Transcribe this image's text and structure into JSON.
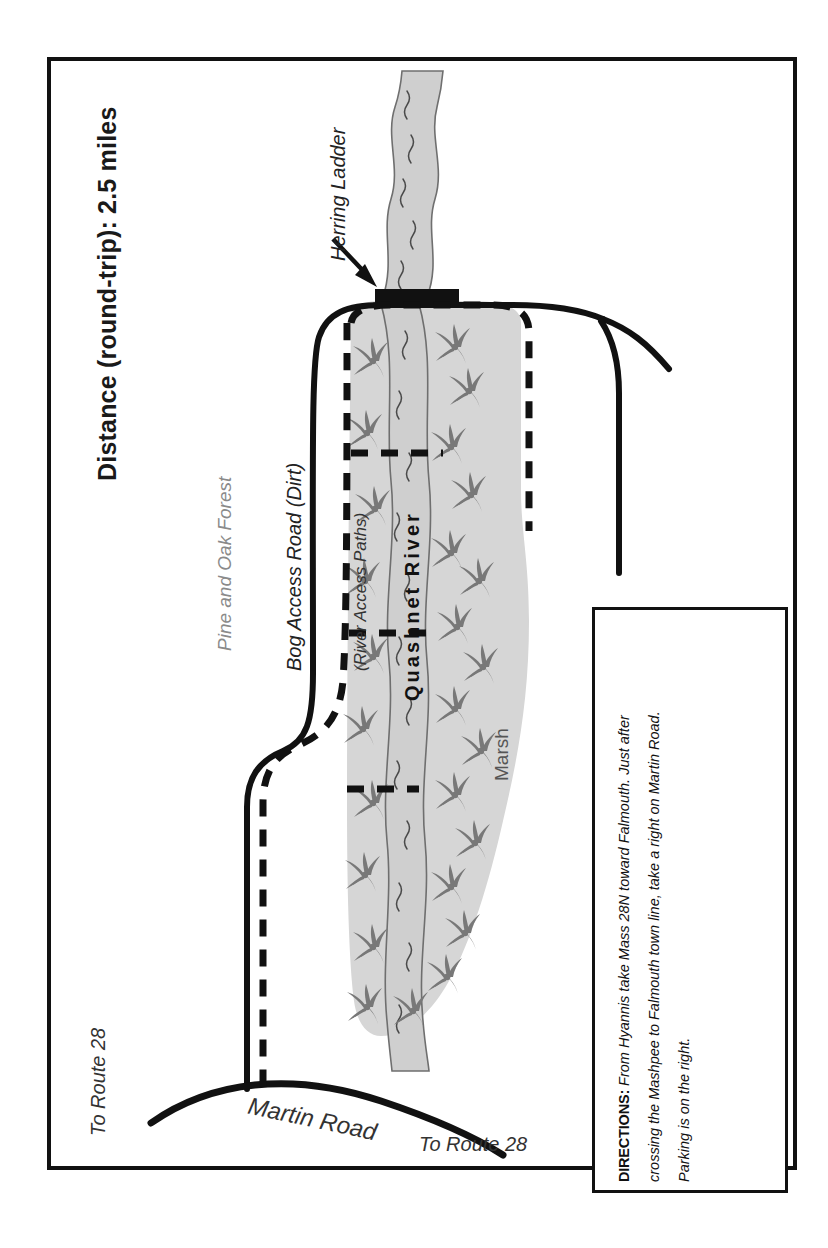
{
  "map": {
    "title": "Distance (round-trip): 2.5 miles",
    "labels": {
      "herring_ladder": "Herring Ladder",
      "pine_oak_forest": "Pine and Oak Forest",
      "bog_access_road": "Bog Access Road (Dirt)",
      "river_access_paths": "(River Access Paths)",
      "quashnet_river": "Quashnet River",
      "marsh": "Marsh",
      "martin_road": "Martin Road",
      "to_route_28_left": "To Route 28",
      "to_route_28_bottom": "To Route 28"
    },
    "directions": {
      "heading": "DIRECTIONS:",
      "line1": " From Hyannis take Mass 28N toward Falmouth. Just after",
      "line2": "crossing the Mashpee to Falmouth town line, take a right on Martin Road.",
      "line3": "Parking is on the right."
    },
    "colors": {
      "ink": "#111111",
      "marsh_fill": "#d6d6d6",
      "river_fill": "#cfcfcf",
      "river_stroke": "#6f6f6f",
      "grass": "#787878",
      "forest_text": "#8a8a8a"
    }
  }
}
